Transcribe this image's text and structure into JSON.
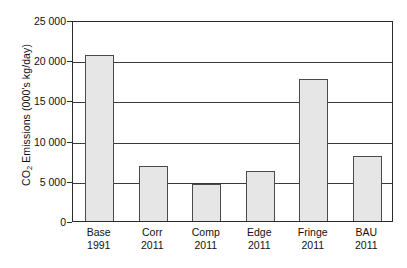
{
  "chart_data": {
    "type": "bar",
    "title": "",
    "xlabel": "",
    "ylabel": "CO2 Emissions (000's kg/day)",
    "ylabel_parts": {
      "pre": "CO",
      "sub": "2",
      "post": " Emissions (000's kg/day)"
    },
    "categories": [
      "Base 1991",
      "Corr 2011",
      "Comp 2011",
      "Edge 2011",
      "Fringe 2011",
      "BAU 2011"
    ],
    "category_lines": [
      {
        "name": "Base",
        "year": "1991"
      },
      {
        "name": "Corr",
        "year": "2011"
      },
      {
        "name": "Comp",
        "year": "2011"
      },
      {
        "name": "Edge",
        "year": "2011"
      },
      {
        "name": "Fringe",
        "year": "2011"
      },
      {
        "name": "BAU",
        "year": "2011"
      }
    ],
    "values": [
      20600,
      6800,
      4650,
      6250,
      17650,
      8050
    ],
    "ylim": [
      0,
      25000
    ],
    "yticks": [
      0,
      5000,
      10000,
      15000,
      20000,
      25000
    ],
    "ytick_labels": [
      "0",
      "5 000",
      "10 000",
      "15 000",
      "20 000",
      "25 000"
    ],
    "grid": true,
    "grid_axis": "y",
    "legend": false,
    "legend_position": "none",
    "bar_fill_color": "#e6e6e6",
    "bar_edge_color": "#4a4a4a",
    "axis_color": "#2b2b2b",
    "grid_color": "#3a3a3a",
    "background_color": "#ffffff"
  }
}
